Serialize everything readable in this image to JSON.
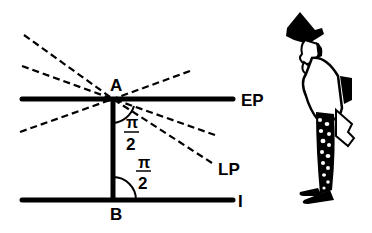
{
  "diagram": {
    "colors": {
      "ink": "#000000",
      "background": "#ffffff"
    },
    "points": {
      "A": {
        "label": "A"
      },
      "B": {
        "label": "B"
      }
    },
    "lines": {
      "ep": {
        "label": "EP",
        "style": "solid"
      },
      "lp": {
        "label": "LP",
        "style": "dashed"
      },
      "i": {
        "label": "I",
        "style": "solid"
      },
      "ab": {
        "label": "AB",
        "style": "solid"
      }
    },
    "angles": [
      {
        "at": "A",
        "numerator": "π",
        "denominator": "2"
      },
      {
        "at": "B",
        "numerator": "π",
        "denominator": "2"
      }
    ],
    "dashed_rays_through_A": 6,
    "illustration": {
      "description": "cartoon man in top hat and spotted trousers, hand to chin, looking at diagram"
    }
  }
}
